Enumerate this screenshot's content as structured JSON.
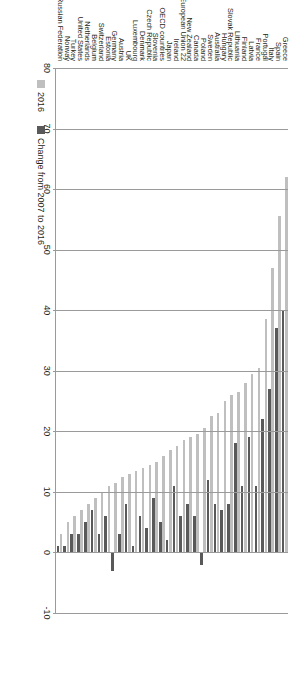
{
  "chart_data": {
    "type": "bar",
    "orientation": "horizontal",
    "title": "",
    "xlabel": "",
    "ylabel": "",
    "xlim": [
      -10,
      80
    ],
    "xticks": [
      80,
      70,
      60,
      50,
      40,
      30,
      20,
      10,
      0,
      -10
    ],
    "xtick_labels": [
      "80",
      "70",
      "60",
      "50",
      "40",
      "30",
      "20",
      "10",
      "0",
      "-10"
    ],
    "grid": true,
    "axis_reversed": true,
    "legend_position": "bottom-left",
    "colors": {
      "series_2016": "#bfbfbf",
      "series_change": "#595959",
      "grid": "#9a9a9a",
      "text": "#231f20"
    },
    "categories": [
      "Greece",
      "Spain",
      "Italy",
      "Portugal",
      "France",
      "Latvia",
      "Finland",
      "Lithuania",
      "Slovak Republic",
      "Hungary",
      "Australia",
      "Sweden",
      "Poland",
      "Canada",
      "New Zealand",
      "European Union 22",
      "Ireland",
      "Japan",
      "OECD countries",
      "Slovenia",
      "Czech Republic",
      "Denmark",
      "Luxembourg",
      "UK",
      "Austria",
      "Germany",
      "Estonia",
      "Switzerland",
      "Belgium",
      "Netherlands",
      "United States",
      "Turkey",
      "Norway",
      "Russian Federation"
    ],
    "series": [
      {
        "name": "2016",
        "values": [
          62.0,
          55.5,
          47.0,
          38.5,
          30.5,
          29.5,
          28.0,
          26.5,
          26.0,
          25.0,
          23.0,
          22.5,
          20.5,
          19.5,
          19.0,
          18.5,
          17.5,
          17.0,
          16.0,
          15.0,
          14.5,
          14.0,
          13.5,
          13.0,
          12.5,
          11.5,
          11.0,
          10.0,
          9.0,
          8.0,
          7.0,
          6.0,
          5.0,
          3.0
        ]
      },
      {
        "name": "Change from 2007 to 2016",
        "values": [
          40.0,
          37.0,
          27.0,
          22.0,
          11.0,
          19.0,
          11.0,
          18.0,
          8.0,
          7.0,
          8.0,
          12.0,
          -2.0,
          6.0,
          8.0,
          6.0,
          11.0,
          2.0,
          5.0,
          9.0,
          4.0,
          6.0,
          1.0,
          8.0,
          3.0,
          -3.0,
          6.0,
          3.0,
          7.0,
          5.0,
          3.0,
          3.0,
          1.0,
          1.0
        ]
      }
    ],
    "legend": [
      {
        "label": "2016",
        "color": "#bfbfbf"
      },
      {
        "label": "Change from 2007 to 2016",
        "color": "#595959"
      }
    ]
  }
}
